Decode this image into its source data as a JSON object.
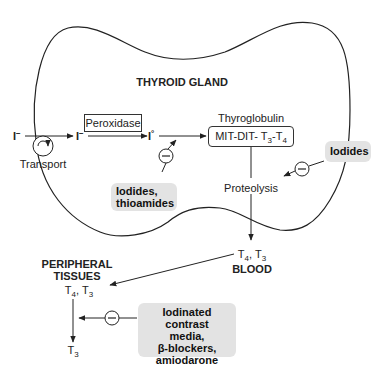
{
  "title": "THYROID GLAND",
  "gland": {
    "title": "THYROID GLAND",
    "iodide_outside": "I",
    "iodide_outside_charge": "−",
    "transport_label": "Transport",
    "iodide_inside": "I",
    "iodide_inside_charge": "−",
    "enzyme_label": "Peroxidase",
    "iodine": "I",
    "iodine_charge": "°",
    "thyroglobulin_label": "Thyroglobulin",
    "thyroglobulin_box": {
      "prefix": "MIT-DIT- T",
      "sub1": "3",
      "mid": "-T",
      "sub2": "4"
    },
    "proteolysis_label": "Proteolysis"
  },
  "inhibitors": {
    "minus_symbol": "−",
    "organification": {
      "line1": "Iodides,",
      "line2": "thioamides"
    },
    "release": {
      "line1": "Iodides"
    },
    "conversion": {
      "line1": "Iodinated contrast",
      "line2": "media,",
      "line3": "β-blockers,",
      "line4": "amiodarone"
    }
  },
  "blood": {
    "hormones": {
      "t": "T",
      "s1": "4",
      "sep": ", T",
      "s2": "3"
    },
    "label": "BLOOD"
  },
  "peripheral": {
    "label_line1": "PERIPHERAL",
    "label_line2": "TISSUES",
    "hormones": {
      "t": "T",
      "s1": "4",
      "sep": ", T",
      "s2": "3"
    },
    "product": {
      "t": "T",
      "s": "3"
    }
  },
  "colors": {
    "line": "#222222",
    "drug_box_bg": "#e3e3e3",
    "background": "#ffffff"
  }
}
